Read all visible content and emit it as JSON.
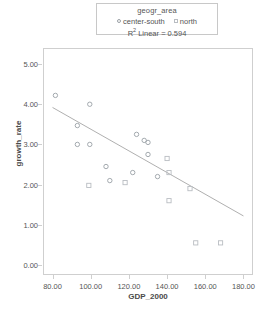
{
  "legend": {
    "title": "geogr_area",
    "keys": [
      {
        "label": "center-south",
        "marker": "circle-open-icon",
        "color": "#9aa0a6"
      },
      {
        "label": "north",
        "marker": "square-open-icon",
        "color": "#b9bdc2"
      }
    ],
    "fit_label_prefix": "R",
    "fit_label_sup": "2",
    "fit_label_suffix": " Linear = 0.594"
  },
  "axes": {
    "x_title": "GDP_2000",
    "y_title": "growth_rate",
    "x_ticks": [
      "80.00",
      "100.00",
      "120.00",
      "140.00",
      "160.00",
      "180.00"
    ],
    "y_ticks": [
      "0.00",
      "1.00",
      "2.00",
      "3.00",
      "4.00",
      "5.00"
    ]
  },
  "chart_data": {
    "type": "scatter",
    "title": "",
    "xlabel": "GDP_2000",
    "ylabel": "growth_rate",
    "xlim": [
      75,
      185
    ],
    "ylim": [
      -0.25,
      5.4
    ],
    "grid": false,
    "legend_position": "top-center",
    "r_squared_linear": 0.594,
    "regression_line": {
      "label": "R2 Linear = 0.594",
      "x": [
        80.0,
        180.0
      ],
      "y": [
        3.92,
        1.22
      ],
      "color": "#9a9a9a"
    },
    "series": [
      {
        "name": "center-south",
        "marker": "circle-open",
        "color": "#9aa0a6",
        "points": [
          {
            "x": 81.5,
            "y": 4.22
          },
          {
            "x": 99.5,
            "y": 4.0
          },
          {
            "x": 93.0,
            "y": 3.47
          },
          {
            "x": 93.0,
            "y": 3.0
          },
          {
            "x": 99.5,
            "y": 3.0
          },
          {
            "x": 108.0,
            "y": 2.45
          },
          {
            "x": 110.0,
            "y": 2.1
          },
          {
            "x": 124.0,
            "y": 3.25
          },
          {
            "x": 128.0,
            "y": 3.1
          },
          {
            "x": 130.0,
            "y": 3.05
          },
          {
            "x": 130.0,
            "y": 2.75
          },
          {
            "x": 122.0,
            "y": 2.3
          },
          {
            "x": 135.0,
            "y": 2.2
          }
        ]
      },
      {
        "name": "north",
        "marker": "square-open",
        "color": "#b9bdc2",
        "points": [
          {
            "x": 99.0,
            "y": 1.98
          },
          {
            "x": 118.0,
            "y": 2.05
          },
          {
            "x": 140.0,
            "y": 2.65
          },
          {
            "x": 141.0,
            "y": 2.3
          },
          {
            "x": 141.0,
            "y": 1.6
          },
          {
            "x": 152.0,
            "y": 1.9
          },
          {
            "x": 155.0,
            "y": 0.55
          },
          {
            "x": 168.0,
            "y": 0.55
          }
        ]
      }
    ]
  }
}
